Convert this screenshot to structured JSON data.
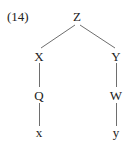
{
  "example_number": "(14)",
  "tree": {
    "root": "Z",
    "left": {
      "label": "X",
      "child": {
        "label": "Q",
        "child": {
          "label": "x"
        }
      }
    },
    "right": {
      "label": "Y",
      "child": {
        "label": "W",
        "child": {
          "label": "y"
        }
      }
    }
  },
  "colors": {
    "line": "#6e6e6e",
    "text": "#222222"
  }
}
